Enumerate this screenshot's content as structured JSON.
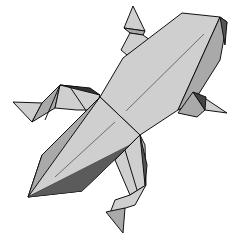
{
  "illustration": {
    "subject": "origami lizard",
    "colors": {
      "light": "#cfcfcf",
      "mid": "#a9a9a9",
      "dark": "#555555",
      "darkest": "#1e1e1e",
      "stroke": "#111111",
      "background": "#ffffff"
    }
  }
}
